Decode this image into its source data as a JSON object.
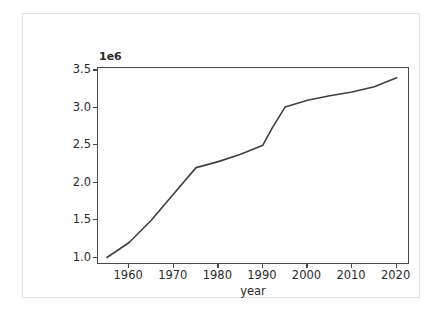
{
  "figure": {
    "background_color": "#ffffff",
    "frame_border_color": "#e2e2e2",
    "axes_color": "#4a4a4a",
    "line_color": "#3f3f46"
  },
  "chart_data": {
    "type": "line",
    "title": "",
    "xlabel": "year",
    "ylabel": "",
    "y_offset_label": "1e6",
    "y_offset_multiplier": 1000000,
    "xlim": [
      1953,
      2023
    ],
    "ylim": [
      900000,
      3530000
    ],
    "grid": false,
    "legend": null,
    "xticks": [
      1960,
      1970,
      1980,
      1990,
      2000,
      2010,
      2020
    ],
    "xtick_labels": [
      "1960",
      "1970",
      "1980",
      "1990",
      "2000",
      "2010",
      "2020"
    ],
    "yticks": [
      1000000,
      1500000,
      2000000,
      2500000,
      3000000,
      3500000
    ],
    "ytick_labels": [
      "1.0",
      "1.5",
      "2.0",
      "2.5",
      "3.0",
      "3.5"
    ],
    "series": [
      {
        "name": "population",
        "x": [
          1955,
          1960,
          1965,
          1970,
          1975,
          1980,
          1985,
          1990,
          1992,
          1995,
          2000,
          2005,
          2010,
          2015,
          2020
        ],
        "values": [
          1000000,
          1200000,
          1500000,
          1850000,
          2200000,
          2280000,
          2380000,
          2500000,
          2720000,
          3010000,
          3100000,
          3160000,
          3210000,
          3280000,
          3400000
        ]
      }
    ]
  }
}
